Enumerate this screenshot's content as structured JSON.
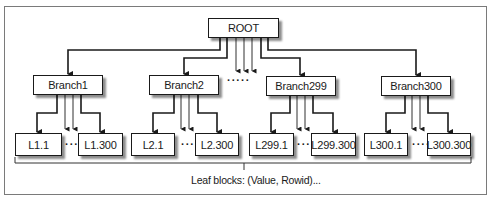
{
  "diagram": {
    "type": "b-tree-index",
    "root": {
      "label": "ROOT"
    },
    "branches": [
      {
        "label": "Branch1",
        "leaves": [
          "L1.1",
          "L1.300"
        ]
      },
      {
        "label": "Branch2",
        "leaves": [
          "L2.1",
          "L2.300"
        ]
      },
      {
        "label": "Branch299",
        "leaves": [
          "L299.1",
          "L299.300"
        ]
      },
      {
        "label": "Branch300",
        "leaves": [
          "L300.1",
          "L300.300"
        ]
      }
    ],
    "root_ellipsis": "·····",
    "leaf_ellipsis": "····",
    "leaf_caption": "Leaf blocks: (Value, Rowid)...",
    "colors": {
      "line": "#1a1a1a",
      "frame": "#7a7a7a",
      "background": "#ffffff"
    }
  }
}
